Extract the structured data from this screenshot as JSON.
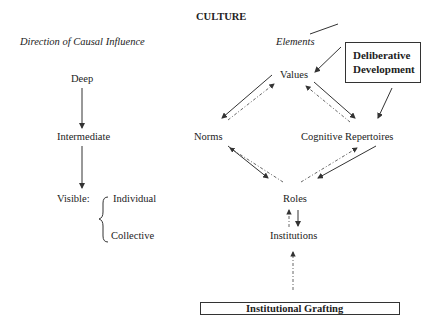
{
  "title": "CULTURE",
  "left_column": {
    "heading": "Direction of Causal Influence",
    "levels": [
      "Deep",
      "Intermediate",
      "Visible:"
    ],
    "visible_types": [
      "Individual",
      "Collective"
    ]
  },
  "right_column": {
    "heading": "Elements",
    "nodes": {
      "values": "Values",
      "norms": "Norms",
      "cognitive": "Cognitive Repertoires",
      "roles": "Roles",
      "institutions": "Institutions"
    },
    "boxes": {
      "deliberative_line1": "Deliberative",
      "deliberative_line2": "Development",
      "grafting": "Institutional Grafting"
    }
  },
  "colors": {
    "ink": "#222222",
    "arrow": "#333333"
  }
}
